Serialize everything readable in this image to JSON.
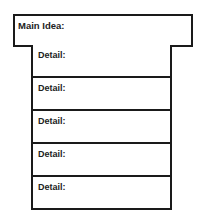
{
  "organizer": {
    "main_idea": {
      "label": "Main Idea:"
    },
    "details": [
      {
        "label": "Detail:"
      },
      {
        "label": "Detail:"
      },
      {
        "label": "Detail:"
      },
      {
        "label": "Detail:"
      },
      {
        "label": "Detail:"
      }
    ]
  }
}
